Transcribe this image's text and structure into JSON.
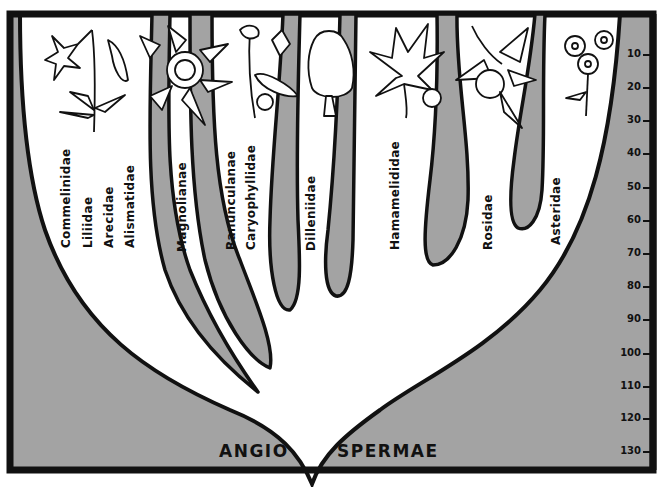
{
  "diagram": {
    "title_left": "ANGIO",
    "title_right": "SPERMAE",
    "colors": {
      "background_fill": "#a3a3a3",
      "lineage_fill": "#a3a3a3",
      "paper": "#ffffff",
      "ink": "#111111"
    },
    "time_scale": {
      "ticks": [
        "10",
        "20",
        "30",
        "40",
        "50",
        "60",
        "70",
        "80",
        "90",
        "100",
        "110",
        "120",
        "130"
      ]
    },
    "lineages": [
      {
        "name": "Commelinidae",
        "illustration": "lily-flower-icon"
      },
      {
        "name": "Liliidae",
        "illustration": "lily-flower-icon"
      },
      {
        "name": "Arecidae",
        "illustration": "lily-flower-icon"
      },
      {
        "name": "Alismatidae",
        "illustration": "lily-flower-icon"
      },
      {
        "name": "Magnolianae",
        "illustration": "magnolia-flower-icon"
      },
      {
        "name": "Ranunculanae",
        "illustration": "columbine-flower-icon"
      },
      {
        "name": "Caryophyllidae",
        "illustration": "columbine-flower-icon"
      },
      {
        "name": "Dilleniidae",
        "illustration": "tree-icon"
      },
      {
        "name": "Hamamelididae",
        "illustration": "maple-leaf-icon"
      },
      {
        "name": "Rosidae",
        "illustration": "apple-branch-icon"
      },
      {
        "name": "Asteridae",
        "illustration": "daisy-flower-icon"
      }
    ]
  }
}
